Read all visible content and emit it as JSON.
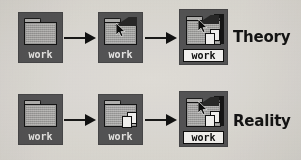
{
  "figure": {
    "background_color": "#e8e6e2",
    "ink_color": "#141414",
    "icon_tile_color": "#58585a",
    "folder_color": "#a8a8a8"
  },
  "rows": [
    {
      "caption": "Theory",
      "steps": [
        {
          "icon_name": "folder-icon",
          "label": "work",
          "label_selected": false,
          "has_cursor": false,
          "has_pages": false,
          "open": false
        },
        {
          "icon_name": "folder-icon-with-cursor",
          "label": "work",
          "label_selected": false,
          "has_cursor": true,
          "has_pages": false,
          "open": true
        },
        {
          "icon_name": "folder-icon-copying-selected",
          "label": "work",
          "label_selected": true,
          "has_cursor": true,
          "has_pages": true,
          "open": true
        }
      ],
      "arrows": [
        "arrow-right",
        "arrow-right"
      ]
    },
    {
      "caption": "Reality",
      "steps": [
        {
          "icon_name": "folder-icon",
          "label": "work",
          "label_selected": false,
          "has_cursor": false,
          "has_pages": false,
          "open": false
        },
        {
          "icon_name": "folder-icon-copying",
          "label": "work",
          "label_selected": false,
          "has_cursor": false,
          "has_pages": true,
          "open": false
        },
        {
          "icon_name": "folder-icon-copying-selected",
          "label": "work",
          "label_selected": true,
          "has_cursor": true,
          "has_pages": true,
          "open": true
        }
      ],
      "arrows": [
        "arrow-right",
        "arrow-right"
      ]
    }
  ]
}
